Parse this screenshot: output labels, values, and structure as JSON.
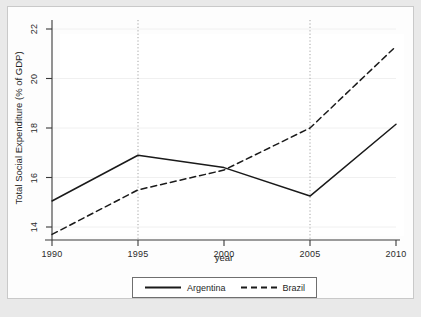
{
  "chart_data": {
    "type": "line",
    "title": "",
    "xlabel": "year",
    "ylabel": "Total Social Expenditure (% of GDP)",
    "x": [
      1990,
      1995,
      2000,
      2005,
      2010
    ],
    "xtick_labels": [
      "1990",
      "1995",
      "2000",
      "2005",
      "2010"
    ],
    "ytick_labels": [
      "14",
      "16",
      "18",
      "20",
      "22"
    ],
    "yticks": [
      14,
      16,
      18,
      20,
      22
    ],
    "xlim": [
      1990,
      2010
    ],
    "ylim": [
      13.4,
      22.2
    ],
    "grid": "horizontal-gridlines-light; vertical-dotted-at-1995-and-2005",
    "legend_position": "below-plot-centered",
    "series": [
      {
        "name": "Argentina",
        "style": "solid",
        "color": "#1a1a1a",
        "values": [
          15.05,
          16.9,
          16.4,
          15.25,
          18.15
        ]
      },
      {
        "name": "Brazil",
        "style": "dashed",
        "color": "#1a1a1a",
        "values": [
          13.7,
          15.5,
          16.3,
          18.0,
          21.3
        ]
      }
    ]
  },
  "legend": {
    "items": [
      {
        "label": "Argentina",
        "style": "solid"
      },
      {
        "label": "Brazil",
        "style": "dashed"
      }
    ]
  },
  "colors": {
    "figure_background": "#e9e9e9",
    "canvas_background": "#fdfdfd",
    "plot_background": "#ffffff",
    "line": "#1a1a1a",
    "gridline": "#f0f0f0",
    "axis": "#3a3a3a"
  }
}
